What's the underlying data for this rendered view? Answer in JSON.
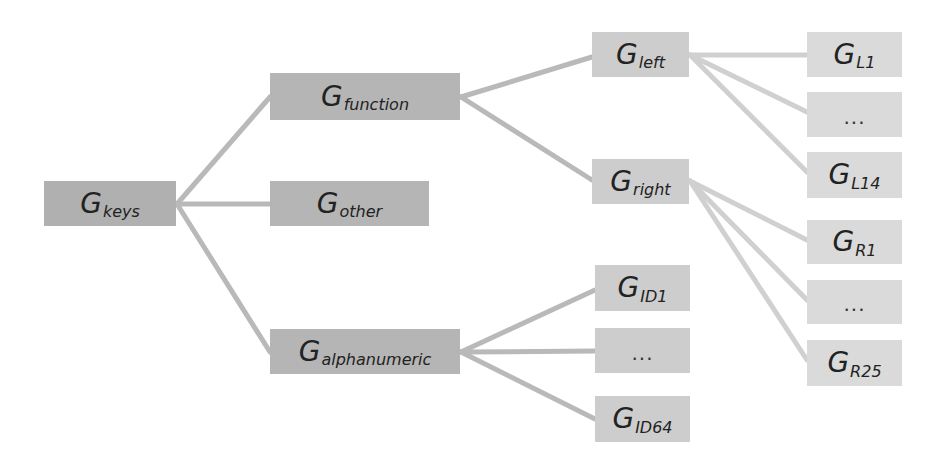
{
  "diagram": {
    "type": "tree",
    "colors": {
      "level1": "#b0b0b0",
      "level2": "#b5b5b5",
      "level3": "#cdcdcd",
      "level4": "#dadada",
      "edge_dark": "#b8b8b8",
      "edge_light": "#d4d4d4"
    },
    "nodes": {
      "keys": {
        "base": "G",
        "sub": "keys"
      },
      "function": {
        "base": "G",
        "sub": "function"
      },
      "other": {
        "base": "G",
        "sub": "other"
      },
      "alphanumeric": {
        "base": "G",
        "sub": "alphanumeric"
      },
      "left": {
        "base": "G",
        "sub": "left"
      },
      "right": {
        "base": "G",
        "sub": "right"
      },
      "id1": {
        "base": "G",
        "sub": "ID1"
      },
      "id_ellipsis": {
        "label": "..."
      },
      "id64": {
        "base": "G",
        "sub": "ID64"
      },
      "l1": {
        "base": "G",
        "sub": "L1"
      },
      "l_ellipsis": {
        "label": "..."
      },
      "l14": {
        "base": "G",
        "sub": "L14"
      },
      "r1": {
        "base": "G",
        "sub": "R1"
      },
      "r_ellipsis": {
        "label": "..."
      },
      "r25": {
        "base": "G",
        "sub": "R25"
      }
    },
    "edges": [
      [
        "keys",
        "function"
      ],
      [
        "keys",
        "other"
      ],
      [
        "keys",
        "alphanumeric"
      ],
      [
        "function",
        "left"
      ],
      [
        "function",
        "right"
      ],
      [
        "alphanumeric",
        "id1"
      ],
      [
        "alphanumeric",
        "id_ellipsis"
      ],
      [
        "alphanumeric",
        "id64"
      ],
      [
        "left",
        "l1"
      ],
      [
        "left",
        "l_ellipsis"
      ],
      [
        "left",
        "l14"
      ],
      [
        "right",
        "r1"
      ],
      [
        "right",
        "r_ellipsis"
      ],
      [
        "right",
        "r25"
      ]
    ]
  }
}
